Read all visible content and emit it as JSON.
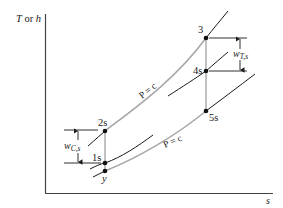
{
  "diagram": {
    "type": "thermodynamic-Ts-diagram",
    "axes": {
      "y_label_T": "T",
      "y_label_or": " or ",
      "y_label_h": "h",
      "x_label": "s"
    },
    "isobar_label": "P = c",
    "points": {
      "p3": "3",
      "p4s": "4s",
      "p5s": "5s",
      "p2s": "2s",
      "p1s": "1s",
      "py": "y"
    },
    "work_labels": {
      "turbine_w": "w",
      "turbine_sub": "T,s",
      "compressor_w": "w",
      "compressor_sub": "C,s"
    },
    "colors": {
      "axis": "#333333",
      "isobar": "#a0a0a0",
      "line": "#1a1a1a",
      "point": "#111111"
    }
  }
}
